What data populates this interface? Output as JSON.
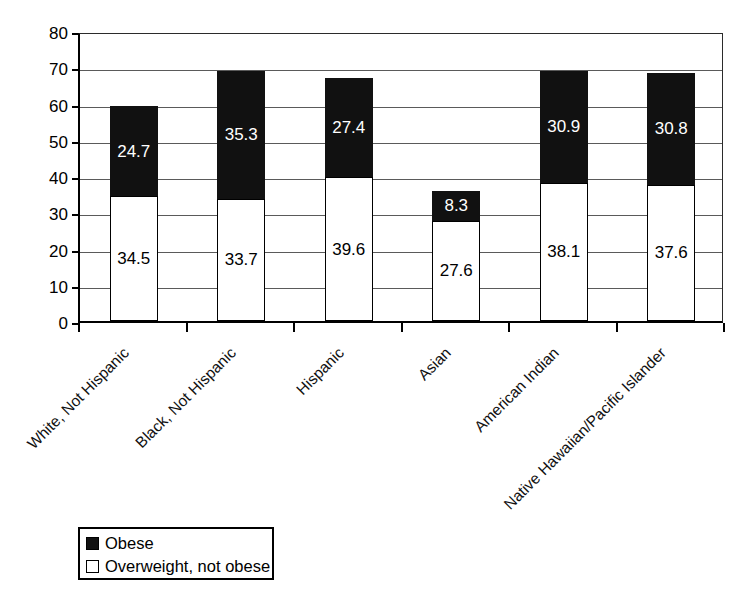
{
  "chart_data": {
    "type": "bar",
    "subtype": "stacked-bar",
    "title": "",
    "xlabel": "",
    "ylabel": "",
    "ylim": [
      0,
      80
    ],
    "ytick_step": 10,
    "yticks": [
      0,
      10,
      20,
      30,
      40,
      50,
      60,
      70,
      80
    ],
    "grid": true,
    "grid_axis": "y",
    "legend_position": "bottom-left",
    "categories": [
      "White, Not Hispanic",
      "Black, Not Hispanic",
      "Hispanic",
      "Asian",
      "American Indian",
      "Native Hawaiian/Pacific Islander"
    ],
    "series": [
      {
        "name": "Overweight, not obese",
        "color": "#ffffff",
        "values": [
          34.5,
          33.7,
          39.6,
          27.6,
          38.1,
          37.6
        ]
      },
      {
        "name": "Obese",
        "color": "#111111",
        "values": [
          24.7,
          35.3,
          27.4,
          8.3,
          30.9,
          30.8
        ]
      }
    ],
    "stack_order": [
      "Overweight, not obese",
      "Obese"
    ],
    "totals": [
      59.2,
      69.0,
      67.0,
      35.9,
      69.0,
      68.4
    ]
  },
  "legend": {
    "items": [
      {
        "label": "Obese",
        "swatch": "obese"
      },
      {
        "label": "Overweight, not obese",
        "swatch": "overweight"
      }
    ]
  }
}
